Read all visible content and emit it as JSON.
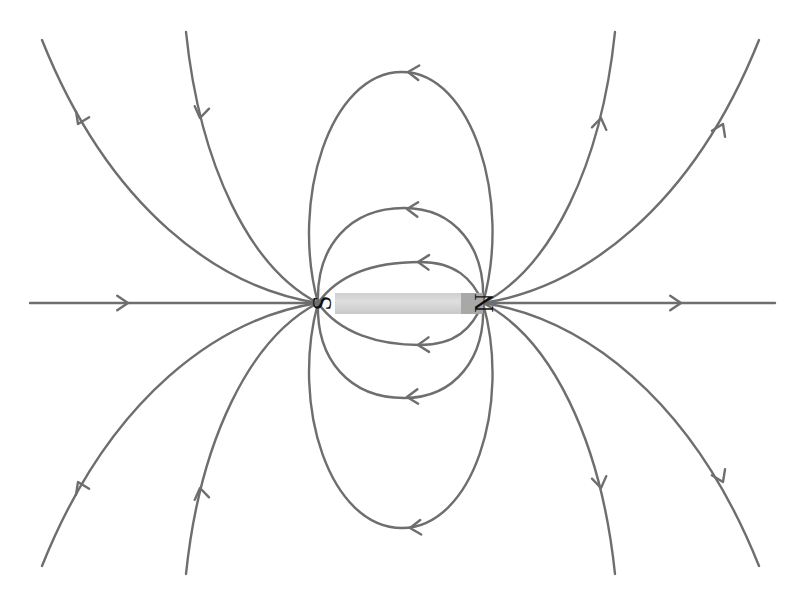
{
  "figure": {
    "background_color": "#ffffff",
    "width": 805,
    "height": 594
  },
  "magnet": {
    "name": "bar-magnet",
    "body_fill": "#d8d8d8",
    "pole_end_fill": "#a8a8a8",
    "x": 335,
    "y": 293,
    "width": 148,
    "height": 21,
    "south_label": "S",
    "north_label": "N",
    "south_label_x": 322,
    "south_label_y": 303,
    "north_label_x": 484,
    "north_label_y": 303,
    "label_rotation_deg": -90
  },
  "poles": {
    "south": {
      "name": "south-pole",
      "x": 318,
      "y": 303,
      "label": "S"
    },
    "north": {
      "name": "north-pole",
      "x": 483,
      "y": 303,
      "label": "N"
    }
  },
  "field": {
    "line_color": "#6e6e6e",
    "line_width": 2.4,
    "flow_description": "out of N, around, into S",
    "lines": [
      {
        "name": "field-line-axis-left",
        "path": "M 30 303 L 318 303",
        "arrows": [
          {
            "x": 128,
            "y": 303,
            "angle": 0
          }
        ]
      },
      {
        "name": "field-line-axis-right",
        "path": "M 483 303 L 775 303",
        "arrows": [
          {
            "x": 681,
            "y": 303,
            "angle": 0
          }
        ]
      },
      {
        "name": "field-line-inner-upper",
        "path": "M 318 303 C 340 272 380 262 420 262 C 455 262 472 278 483 303",
        "arrows": [
          {
            "x": 418,
            "y": 262,
            "angle": 182
          }
        ]
      },
      {
        "name": "field-line-inner-lower",
        "path": "M 318 303 C 340 334 380 345 420 345 C 455 345 472 329 483 303",
        "arrows": [
          {
            "x": 418,
            "y": 345,
            "angle": 178
          }
        ]
      },
      {
        "name": "field-line-mid-upper",
        "path": "M 318 303 C 316 246 350 208 404 208 C 455 208 486 248 483 303",
        "arrows": [
          {
            "x": 407,
            "y": 209,
            "angle": 183
          }
        ]
      },
      {
        "name": "field-line-mid-lower",
        "path": "M 318 303 C 316 360 350 398 404 398 C 455 398 486 358 483 303",
        "arrows": [
          {
            "x": 407,
            "y": 397,
            "angle": 177
          }
        ]
      },
      {
        "name": "field-line-large-upper",
        "path": "M 318 303 C 290 200 330 72 402 72 C 472 72 512 200 483 303",
        "arrows": [
          {
            "x": 408,
            "y": 72,
            "angle": 184
          }
        ]
      },
      {
        "name": "field-line-large-lower",
        "path": "M 318 303 C 290 406 330 528 402 528 C 472 528 512 406 483 303",
        "arrows": [
          {
            "x": 410,
            "y": 528,
            "angle": 176
          }
        ]
      },
      {
        "name": "field-line-outer-upper-left",
        "path": "M 318 303 C 250 268 200 166 186 32",
        "arrows": [
          {
            "x": 200,
            "y": 118,
            "angle": 100
          }
        ]
      },
      {
        "name": "field-line-outer-upper-right",
        "path": "M 483 303 C 551 268 601 166 615 32",
        "arrows": [
          {
            "x": 601,
            "y": 118,
            "angle": 280
          }
        ]
      },
      {
        "name": "field-line-outer-lower-left",
        "path": "M 318 303 C 250 338 200 440 186 574",
        "arrows": [
          {
            "x": 200,
            "y": 488,
            "angle": 260
          }
        ]
      },
      {
        "name": "field-line-outer-lower-right",
        "path": "M 483 303 C 551 338 601 440 615 574",
        "arrows": [
          {
            "x": 601,
            "y": 488,
            "angle": 80
          }
        ]
      },
      {
        "name": "field-line-far-upper-left",
        "path": "M 318 303 C 220 288 110 210 42 40",
        "arrows": [
          {
            "x": 78,
            "y": 124,
            "angle": 115
          }
        ]
      },
      {
        "name": "field-line-far-upper-right",
        "path": "M 483 303 C 581 288 691 210 759 40",
        "arrows": [
          {
            "x": 723,
            "y": 124,
            "angle": 295
          }
        ]
      },
      {
        "name": "field-line-far-lower-left",
        "path": "M 318 303 C 220 318 110 396 42 566",
        "arrows": [
          {
            "x": 78,
            "y": 482,
            "angle": 245
          }
        ]
      },
      {
        "name": "field-line-far-lower-right",
        "path": "M 483 303 C 581 318 691 396 759 566",
        "arrows": [
          {
            "x": 723,
            "y": 482,
            "angle": 65
          }
        ]
      }
    ]
  }
}
